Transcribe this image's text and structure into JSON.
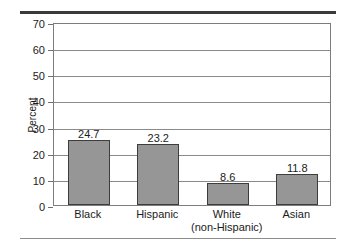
{
  "chart_data": {
    "type": "bar",
    "title": "",
    "subtitle": "",
    "xlabel": "",
    "ylabel": "Percent",
    "ylim": [
      0,
      70
    ],
    "ytick_step": 10,
    "yticks": [
      70,
      60,
      50,
      40,
      30,
      20,
      10,
      0
    ],
    "grid": true,
    "legend": "none",
    "categories": [
      "Black",
      "Hispanic",
      "White\n(non-Hispanic)",
      "Asian"
    ],
    "category_lines": [
      [
        "Black"
      ],
      [
        "Hispanic"
      ],
      [
        "White",
        "(non-Hispanic)"
      ],
      [
        "Asian"
      ]
    ],
    "values": [
      24.7,
      23.2,
      8.6,
      11.8
    ],
    "value_labels": [
      "24.7",
      "23.2",
      "8.6",
      "11.8"
    ],
    "bar_color": "#969696",
    "bar_edge_color": "#3d3d3d",
    "grid_color": "#8a8a8a",
    "frame_color": "#7d7d7d",
    "background_color": "#ffffff"
  },
  "decoration": {
    "rule_top_color": "#3a3a3a",
    "rule_bottom_color": "#8d8d8d"
  }
}
